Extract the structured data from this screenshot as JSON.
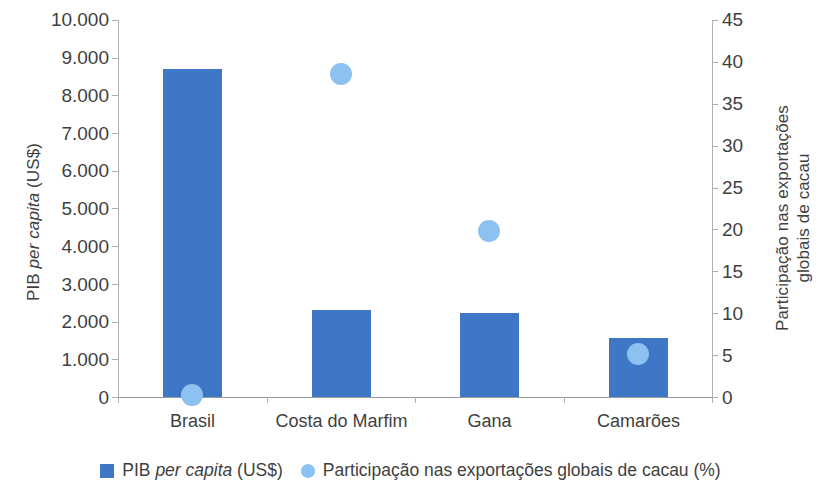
{
  "chart_data": {
    "type": "bar",
    "title": "",
    "categories": [
      "Brasil",
      "Costa do Marfim",
      "Gana",
      "Camarões"
    ],
    "series": [
      {
        "name": "PIB per capita (US$)",
        "type": "bar",
        "axis": "left",
        "color": "#3d77c6",
        "values": [
          8700,
          2310,
          2230,
          1560
        ]
      },
      {
        "name": "Participação nas exportações globais de cacau (%)",
        "type": "scatter",
        "axis": "right",
        "color": "#8cc1f2",
        "values": [
          0.2,
          38.5,
          19.8,
          5.1
        ]
      }
    ],
    "xlabel": "",
    "ylabel": "PIB per capita (US$)",
    "y2label": "Participação nas exportações globais de cacau",
    "ylim": [
      0,
      10000
    ],
    "y2lim": [
      0,
      45
    ],
    "yticks": [
      "0",
      "1.000",
      "2.000",
      "3.000",
      "4.000",
      "5.000",
      "6.000",
      "7.000",
      "8.000",
      "9.000",
      "10.000"
    ],
    "y2ticks": [
      "0",
      "5",
      "10",
      "15",
      "20",
      "25",
      "30",
      "35",
      "40",
      "45"
    ],
    "grid": false,
    "legend_position": "bottom"
  },
  "axes": {
    "left_title_parts": {
      "pre": "PIB ",
      "italic": "per capita",
      "post": " (US$)"
    },
    "right_title_line1": "Participação nas exportações",
    "right_title_line2": "globais de cacau"
  },
  "legend": {
    "items": [
      {
        "marker": "square-swatch-icon",
        "pre": "PIB ",
        "italic": "per capita",
        "post": " (US$)"
      },
      {
        "marker": "circle-swatch-icon",
        "pre": "Participação nas exportações globais de cacau (%)",
        "italic": "",
        "post": ""
      }
    ]
  }
}
